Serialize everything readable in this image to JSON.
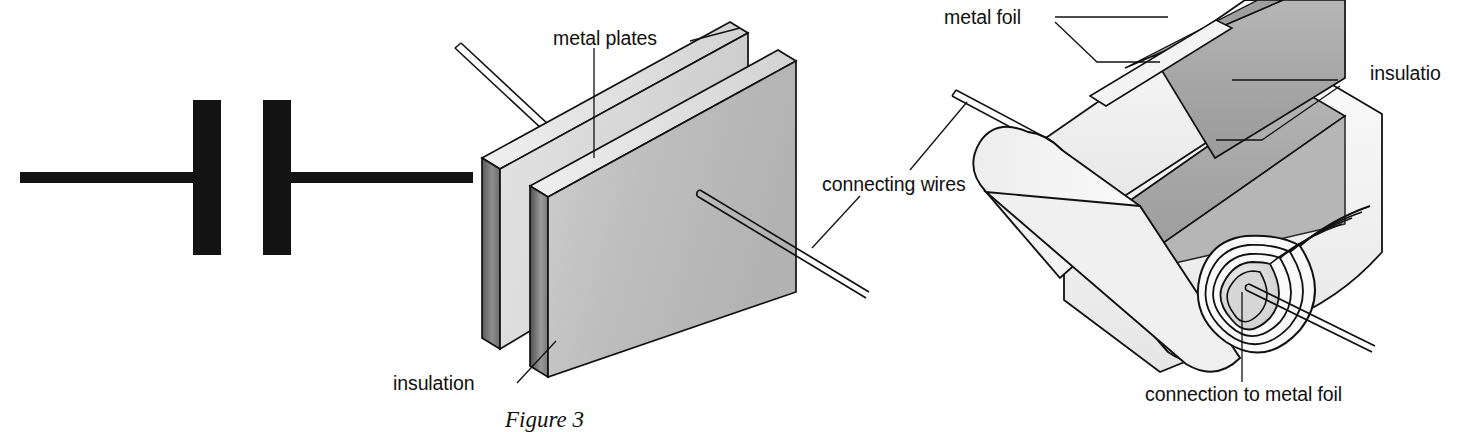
{
  "figure": {
    "caption": "Figure 3",
    "background_color": "#ffffff",
    "ink_color": "#111111"
  },
  "panels": [
    {
      "id": "circuit-symbol",
      "name": "capacitor circuit symbol",
      "labels": []
    },
    {
      "id": "parallel-plate-capacitor",
      "name": "parallel plate capacitor cutaway",
      "labels": [
        "metal plates",
        "connecting wires",
        "insulation"
      ]
    },
    {
      "id": "rolled-foil-capacitor",
      "name": "rolled foil capacitor cutaway",
      "labels": [
        "metal foil",
        "insulation",
        "connection to metal foil"
      ]
    }
  ],
  "labels": {
    "metal_plates": "metal plates",
    "connecting_wires": "connecting wires",
    "insulation_plate": "insulation",
    "metal_foil": "metal foil",
    "insulation_roll": "insulatio",
    "connection_to_metal_foil": "connection to metal foil"
  },
  "colors": {
    "plate_face": "#bdbdbd",
    "plate_face_light": "#d8d8d8",
    "plate_edge_dark": "#4a4a4a",
    "foil_gray": "#a8a8a8",
    "insulation_white": "#f2f2f2",
    "outline": "#111111",
    "symbol_black": "#131313"
  }
}
